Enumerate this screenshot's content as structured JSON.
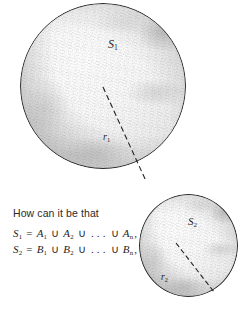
{
  "figure": {
    "background_color": "#ffffff",
    "outline_color": "#2b2b2b",
    "text_color": "#1e1e1e",
    "spheres": [
      {
        "id": "s1",
        "label": "S",
        "label_subscript": "1",
        "radius_label": "r",
        "radius_subscript": "1",
        "x": 20,
        "y": 3,
        "diameter": 166
      },
      {
        "id": "s2",
        "label": "S",
        "label_subscript": "2",
        "radius_label": "r",
        "radius_subscript": "2",
        "x": 139,
        "y": 194,
        "diameter": 99
      }
    ]
  },
  "caption": {
    "question": "How can it be that",
    "equations": [
      {
        "lhs": "S",
        "lhs_sub": "1",
        "eq": "=",
        "term1": "A",
        "term1_sub": "1",
        "union1": "∪",
        "term2": "A",
        "term2_sub": "2",
        "union2": "∪",
        "ellipsis": ". . .",
        "union3": "∪",
        "termn": "A",
        "termn_sub": "n",
        "punctuation": ","
      },
      {
        "lhs": "S",
        "lhs_sub": "2",
        "eq": "=",
        "term1": "B",
        "term1_sub": "1",
        "union1": "∪",
        "term2": "B",
        "term2_sub": "2",
        "union2": "∪",
        "ellipsis": ". . .",
        "union3": "∪",
        "termn": "B",
        "termn_sub": "n",
        "punctuation": ","
      }
    ]
  }
}
